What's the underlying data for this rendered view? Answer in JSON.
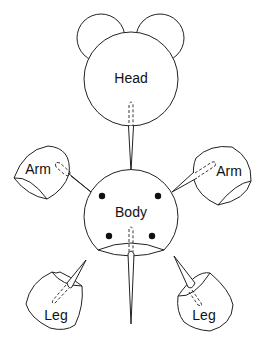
{
  "diagram": {
    "type": "assembly-diagram",
    "parts": [
      {
        "id": "head",
        "label": "Head"
      },
      {
        "id": "body",
        "label": "Body"
      },
      {
        "id": "arm-left",
        "label": "Arm"
      },
      {
        "id": "arm-right",
        "label": "Arm"
      },
      {
        "id": "leg-left",
        "label": "Leg"
      },
      {
        "id": "leg-right",
        "label": "Leg"
      }
    ],
    "connections": [
      {
        "from": "head",
        "to": "body",
        "via": "peg"
      },
      {
        "from": "arm-left",
        "to": "body",
        "via": "peg"
      },
      {
        "from": "arm-right",
        "to": "body",
        "via": "peg"
      },
      {
        "from": "body",
        "to": "leg-left",
        "via": "peg"
      },
      {
        "from": "body",
        "to": "leg-right",
        "via": "peg"
      }
    ],
    "body_holes": 4
  },
  "colors": {
    "stroke": "#222222",
    "background": "#ffffff"
  }
}
